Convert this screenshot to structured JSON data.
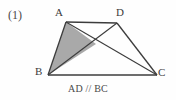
{
  "figure": {
    "problem_number": "(1)",
    "caption": "AD // BC",
    "canvas": {
      "width": 176,
      "height": 100
    },
    "background_color": "#fefefe",
    "stroke_color": "#3c3c3c",
    "shade_color": "#a9a9a9",
    "vertices": [
      {
        "name": "A",
        "label": "A",
        "x": 66,
        "y": 22
      },
      {
        "name": "D",
        "label": "D",
        "x": 117,
        "y": 23
      },
      {
        "name": "B",
        "label": "B",
        "x": 48,
        "y": 75
      },
      {
        "name": "C",
        "label": "C",
        "x": 157,
        "y": 75
      }
    ],
    "intersection": {
      "name": "P",
      "x": 96,
      "y": 44
    },
    "edges": [
      {
        "name": "AD",
        "from": "A",
        "to": "D"
      },
      {
        "name": "BC",
        "from": "B",
        "to": "C"
      },
      {
        "name": "AB",
        "from": "A",
        "to": "B"
      },
      {
        "name": "DC",
        "from": "D",
        "to": "C"
      }
    ],
    "diagonals": [
      {
        "name": "AC",
        "from": "A",
        "to": "C"
      },
      {
        "name": "BD",
        "from": "B",
        "to": "D"
      }
    ],
    "shaded_region": {
      "name": "triangle-ABP",
      "points": "A,B,P"
    }
  }
}
